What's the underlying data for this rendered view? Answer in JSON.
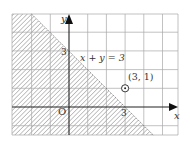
{
  "diagram": {
    "type": "inequality-region",
    "axes": {
      "x_label": "x",
      "y_label": "y",
      "origin_label": "O",
      "x_tick_label": "3",
      "y_tick_label": "3",
      "x_range": [
        -3,
        5.8
      ],
      "y_range": [
        -1.5,
        5
      ],
      "grid_unit": 1
    },
    "line": {
      "equation_label": "x + y = 3",
      "points": [
        [
          -2,
          5
        ],
        [
          4.5,
          -1.5
        ]
      ]
    },
    "shaded_region": {
      "description": "x + y < 3 (below-left of line)",
      "pattern": "diagonal hatching"
    },
    "point": {
      "label": "(3, 1)",
      "x": 3,
      "y": 1,
      "marker": "circled-dot"
    },
    "colors": {
      "grid": "#a8a8a8",
      "axis": "#222222",
      "hatch": "#8a8a8a",
      "text": "#333333",
      "background": "#ffffff"
    }
  }
}
